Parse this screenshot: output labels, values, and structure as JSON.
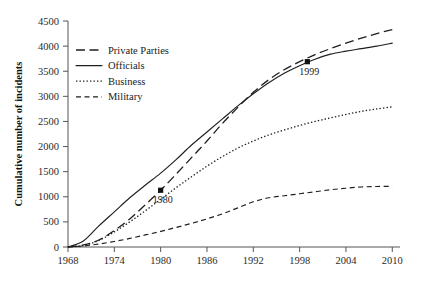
{
  "chart_data": {
    "type": "line",
    "title": "",
    "xlabel": "",
    "ylabel": "Cumulative number of incidents",
    "xlim": [
      1968,
      2011
    ],
    "ylim": [
      0,
      4500
    ],
    "grid": false,
    "legend_position": "upper-left",
    "xticks": [
      "1968",
      "1974",
      "1980",
      "1986",
      "1992",
      "1998",
      "2004",
      "2010"
    ],
    "xtick_values": [
      1968,
      1974,
      1980,
      1986,
      1992,
      1998,
      2004,
      2010
    ],
    "yticks": [
      "0",
      "500",
      "1000",
      "1500",
      "2000",
      "2500",
      "3000",
      "3500",
      "4000",
      "4500"
    ],
    "ytick_values": [
      0,
      500,
      1000,
      1500,
      2000,
      2500,
      3000,
      3500,
      4000,
      4500
    ],
    "x": [
      1968,
      1970,
      1972,
      1974,
      1976,
      1978,
      1980,
      1982,
      1984,
      1986,
      1988,
      1990,
      1992,
      1994,
      1996,
      1998,
      2000,
      2002,
      2004,
      2006,
      2008,
      2010
    ],
    "series": [
      {
        "name": "Private Parties",
        "dash": "long-dash",
        "color": "#1f1f1f",
        "values": [
          0,
          40,
          140,
          330,
          560,
          840,
          1130,
          1450,
          1780,
          2110,
          2460,
          2780,
          3080,
          3330,
          3530,
          3690,
          3830,
          3950,
          4060,
          4160,
          4250,
          4330
        ]
      },
      {
        "name": "Officials",
        "dash": "solid",
        "color": "#1f1f1f",
        "values": [
          0,
          120,
          420,
          700,
          980,
          1230,
          1470,
          1740,
          2030,
          2290,
          2550,
          2810,
          3050,
          3270,
          3460,
          3610,
          3740,
          3840,
          3900,
          3950,
          4000,
          4060
        ]
      },
      {
        "name": "Business",
        "dash": "dotted",
        "color": "#1f1f1f",
        "values": [
          0,
          30,
          130,
          300,
          500,
          720,
          950,
          1180,
          1400,
          1610,
          1800,
          1970,
          2110,
          2230,
          2330,
          2420,
          2500,
          2570,
          2640,
          2700,
          2750,
          2790
        ]
      },
      {
        "name": "Military",
        "dash": "dash",
        "color": "#1f1f1f",
        "values": [
          0,
          20,
          60,
          110,
          170,
          240,
          310,
          390,
          470,
          560,
          660,
          780,
          900,
          980,
          1020,
          1060,
          1100,
          1140,
          1170,
          1195,
          1205,
          1210
        ]
      }
    ],
    "annotations": [
      {
        "label": "1980",
        "x": 1980,
        "y": 1130,
        "series": "Private Parties"
      },
      {
        "label": "1999",
        "x": 1999,
        "y": 3690,
        "series": "Officials"
      }
    ]
  },
  "legend": {
    "items": [
      {
        "label": "Private Parties",
        "dash": "long-dash"
      },
      {
        "label": "Officials",
        "dash": "solid"
      },
      {
        "label": "Business",
        "dash": "dotted"
      },
      {
        "label": "Military",
        "dash": "dash"
      }
    ]
  }
}
